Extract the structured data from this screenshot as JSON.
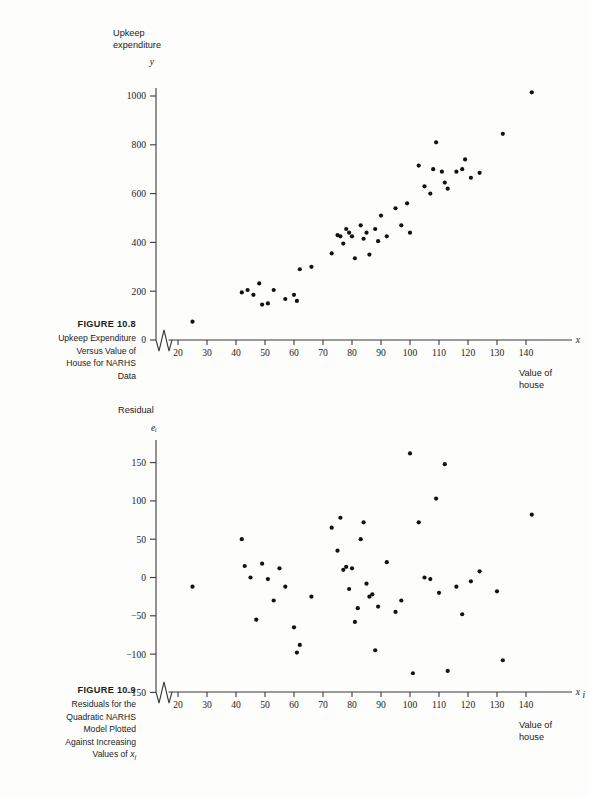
{
  "page": {
    "background": "#fdfdfc",
    "ink": "#1a1a1a",
    "dot_color": "#111111"
  },
  "figures": [
    {
      "id": "figure-1",
      "caption": {
        "title": "FIGURE  10.8",
        "lines": [
          "Upkeep Expenditure",
          "Versus Value of",
          "House for NARHS",
          "Data"
        ]
      }
    },
    {
      "id": "figure-2",
      "caption": {
        "title": "FIGURE  10.9",
        "lines": [
          "Residuals for the",
          "Quadratic NARHS",
          "Model Plotted",
          "Against Increasing",
          "Values of xᵢ"
        ]
      }
    }
  ],
  "chart_data": [
    {
      "type": "scatter",
      "title": "Upkeep Expenditure Versus Value of House for NARHS Data",
      "xlabel": "Value of house",
      "x_var": "x",
      "ylabel": "Upkeep expenditure",
      "y_var": "y",
      "grid": false,
      "legend": null,
      "axis_break_x": true,
      "xlim": [
        15,
        147
      ],
      "ylim": [
        0,
        1080
      ],
      "xticks": [
        20,
        30,
        40,
        50,
        60,
        70,
        80,
        90,
        100,
        110,
        120,
        130,
        140
      ],
      "yticks": [
        0,
        200,
        400,
        600,
        800,
        1000
      ],
      "points": [
        [
          25,
          75
        ],
        [
          42,
          195
        ],
        [
          44,
          205
        ],
        [
          46,
          185
        ],
        [
          48,
          232
        ],
        [
          49,
          145
        ],
        [
          51,
          150
        ],
        [
          53,
          205
        ],
        [
          57,
          168
        ],
        [
          60,
          185
        ],
        [
          61,
          160
        ],
        [
          62,
          290
        ],
        [
          66,
          300
        ],
        [
          73,
          355
        ],
        [
          75,
          430
        ],
        [
          76,
          425
        ],
        [
          77,
          395
        ],
        [
          78,
          455
        ],
        [
          79,
          440
        ],
        [
          80,
          425
        ],
        [
          81,
          335
        ],
        [
          83,
          470
        ],
        [
          84,
          415
        ],
        [
          85,
          440
        ],
        [
          86,
          350
        ],
        [
          88,
          455
        ],
        [
          89,
          405
        ],
        [
          90,
          510
        ],
        [
          92,
          425
        ],
        [
          95,
          540
        ],
        [
          97,
          470
        ],
        [
          99,
          560
        ],
        [
          100,
          440
        ],
        [
          103,
          715
        ],
        [
          105,
          630
        ],
        [
          107,
          600
        ],
        [
          108,
          700
        ],
        [
          109,
          810
        ],
        [
          111,
          690
        ],
        [
          112,
          645
        ],
        [
          113,
          620
        ],
        [
          116,
          690
        ],
        [
          118,
          700
        ],
        [
          119,
          740
        ],
        [
          121,
          665
        ],
        [
          124,
          685
        ],
        [
          132,
          845
        ],
        [
          142,
          1015
        ]
      ]
    },
    {
      "type": "scatter",
      "title": "Residuals for the Quadratic NARHS Model Plotted Against Increasing Values of x_i",
      "xlabel": "Value of house",
      "x_var": "xᵢ",
      "ylabel": "Residual",
      "y_var": "eᵢ",
      "grid": false,
      "legend": null,
      "axis_break_x": true,
      "xlim": [
        15,
        147
      ],
      "ylim": [
        -160,
        175
      ],
      "xticks": [
        20,
        30,
        40,
        50,
        60,
        70,
        80,
        90,
        100,
        110,
        120,
        130,
        140
      ],
      "yticks": [
        -150,
        -100,
        -50,
        0,
        50,
        100,
        150
      ],
      "points": [
        [
          25,
          -12
        ],
        [
          42,
          50
        ],
        [
          43,
          15
        ],
        [
          45,
          0
        ],
        [
          47,
          -55
        ],
        [
          49,
          18
        ],
        [
          51,
          -2
        ],
        [
          53,
          -30
        ],
        [
          55,
          12
        ],
        [
          57,
          -12
        ],
        [
          60,
          -65
        ],
        [
          61,
          -98
        ],
        [
          62,
          -88
        ],
        [
          66,
          -25
        ],
        [
          73,
          65
        ],
        [
          75,
          35
        ],
        [
          76,
          78
        ],
        [
          77,
          10
        ],
        [
          78,
          14
        ],
        [
          79,
          -15
        ],
        [
          80,
          12
        ],
        [
          81,
          -58
        ],
        [
          82,
          -40
        ],
        [
          83,
          50
        ],
        [
          84,
          72
        ],
        [
          85,
          -8
        ],
        [
          86,
          -25
        ],
        [
          87,
          -22
        ],
        [
          88,
          -95
        ],
        [
          89,
          -38
        ],
        [
          92,
          20
        ],
        [
          95,
          -45
        ],
        [
          97,
          -30
        ],
        [
          100,
          162
        ],
        [
          101,
          -125
        ],
        [
          103,
          72
        ],
        [
          105,
          0
        ],
        [
          107,
          -2
        ],
        [
          109,
          103
        ],
        [
          110,
          -20
        ],
        [
          112,
          148
        ],
        [
          113,
          -122
        ],
        [
          116,
          -12
        ],
        [
          118,
          -48
        ],
        [
          121,
          -5
        ],
        [
          124,
          8
        ],
        [
          130,
          -18
        ],
        [
          132,
          -108
        ],
        [
          142,
          82
        ]
      ]
    }
  ]
}
